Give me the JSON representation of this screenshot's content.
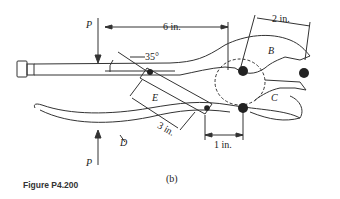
{
  "figure": {
    "caption": "Figure P4.200",
    "subfigure_label": "(b)",
    "force_label_top": "P",
    "force_label_bottom": "P",
    "dim_6in": "6 in.",
    "dim_2in": "2 in.",
    "dim_3in": "3 in.",
    "dim_1in": "1 in.",
    "angle": "35°",
    "part_B": "B",
    "part_C": "C",
    "part_D": "D",
    "part_E": "E"
  }
}
